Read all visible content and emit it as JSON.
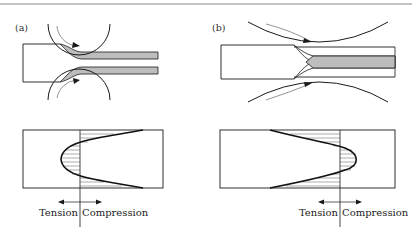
{
  "figure": {
    "panels": [
      {
        "id": "a",
        "label": "(a)",
        "description": "Rolling with small rolls: deformation at surface, inhomogeneous"
      },
      {
        "id": "b",
        "label": "(b)",
        "description": "Rolling with large rolls: center deformation, chevron at core"
      }
    ],
    "stress_diagrams": [
      {
        "id": "a",
        "tension_label": "Tension",
        "compression_label": "Compression"
      },
      {
        "id": "b",
        "tension_label": "Tension",
        "compression_label": "Compression"
      }
    ],
    "colors": {
      "line": "#1a1a1a",
      "fill_grey": "#bdbdbd",
      "rule": "#7a7a7a",
      "background": "#ffffff"
    }
  }
}
